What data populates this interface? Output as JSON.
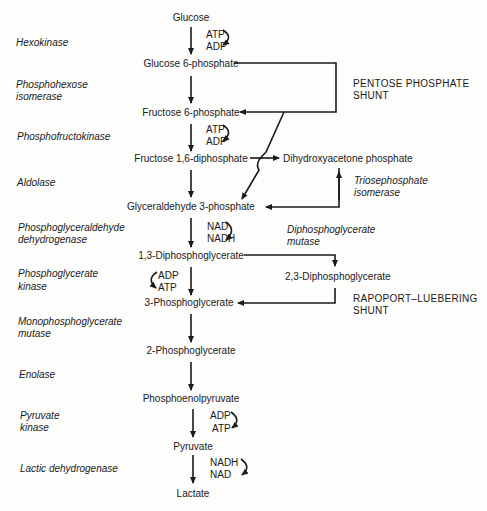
{
  "diagram": {
    "type": "metabolic-pathway",
    "metabolites": [
      {
        "id": "glucose",
        "label": "Glucose"
      },
      {
        "id": "g6p",
        "label": "Glucose 6-phosphate"
      },
      {
        "id": "f6p",
        "label": "Fructose 6-phosphate"
      },
      {
        "id": "f16dp",
        "label": "Fructose 1,6-diphosphate"
      },
      {
        "id": "dhap",
        "label": "Dihydroxyacetone phosphate"
      },
      {
        "id": "g3p",
        "label": "Glyceraldehyde 3-phosphate"
      },
      {
        "id": "bpg13",
        "label": "1,3-Diphosphoglycerate"
      },
      {
        "id": "bpg23",
        "label": "2,3-Diphosphoglycerate"
      },
      {
        "id": "pg3",
        "label": "3-Phosphoglycerate"
      },
      {
        "id": "pg2",
        "label": "2-Phosphoglycerate"
      },
      {
        "id": "pep",
        "label": "Phosphoenolpyruvate"
      },
      {
        "id": "pyruvate",
        "label": "Pyruvate"
      },
      {
        "id": "lactate",
        "label": "Lactate"
      }
    ],
    "enzymes": [
      {
        "id": "hk",
        "label": "Hexokinase"
      },
      {
        "id": "phi_1",
        "label": "Phosphohexose"
      },
      {
        "id": "phi_2",
        "label": "isomerase"
      },
      {
        "id": "pfk",
        "label": "Phosphofructokinase"
      },
      {
        "id": "ald",
        "label": "Aldolase"
      },
      {
        "id": "gapdh_1",
        "label": "Phosphoglyceraldehyde"
      },
      {
        "id": "gapdh_2",
        "label": "dehydrogenase"
      },
      {
        "id": "pgk_1",
        "label": "Phosphoglycerate"
      },
      {
        "id": "pgk_2",
        "label": "kinase"
      },
      {
        "id": "pgm_1",
        "label": "Monophosphoglycerate"
      },
      {
        "id": "pgm_2",
        "label": "mutase"
      },
      {
        "id": "eno",
        "label": "Enolase"
      },
      {
        "id": "pk_1",
        "label": "Pyruvate"
      },
      {
        "id": "pk_2",
        "label": "kinase"
      },
      {
        "id": "ldh",
        "label": "Lactic dehydrogenase"
      },
      {
        "id": "tpi_1",
        "label": "Triosephosphate"
      },
      {
        "id": "tpi_2",
        "label": "isomerase"
      },
      {
        "id": "dpgm_1",
        "label": "Diphosphoglycerate"
      },
      {
        "id": "dpgm_2",
        "label": "mutase"
      }
    ],
    "cofactors": {
      "hk": {
        "in": "ATP",
        "out": "ADP"
      },
      "pfk": {
        "in": "ATP",
        "out": "ADP"
      },
      "gapdh": {
        "in": "NAD",
        "out": "NADH"
      },
      "pgk": {
        "in": "ADP",
        "out": "ATP"
      },
      "pk": {
        "in": "ADP",
        "out": "ATP"
      },
      "ldh": {
        "in": "NADH",
        "out": "NAD"
      }
    },
    "shunts": {
      "pentose_1": "PENTOSE PHOSPHATE",
      "pentose_2": "SHUNT",
      "rapoport_1": "RAPOPORT–LUEBERING",
      "rapoport_2": "SHUNT"
    },
    "edges": [
      {
        "from": "glucose",
        "to": "g6p",
        "enzyme": "Hexokinase"
      },
      {
        "from": "g6p",
        "to": "f6p",
        "enzyme": "Phosphohexose isomerase"
      },
      {
        "from": "g6p",
        "to": "f6p",
        "via": "Pentose phosphate shunt"
      },
      {
        "from": "g6p",
        "to": "g3p",
        "via": "Pentose phosphate shunt"
      },
      {
        "from": "f6p",
        "to": "f16dp",
        "enzyme": "Phosphofructokinase"
      },
      {
        "from": "f16dp",
        "to": "g3p",
        "enzyme": "Aldolase"
      },
      {
        "from": "f16dp",
        "to": "dhap",
        "enzyme": "Aldolase"
      },
      {
        "from": "dhap",
        "to": "g3p",
        "enzyme": "Triosephosphate isomerase",
        "bidirectional": true
      },
      {
        "from": "g3p",
        "to": "bpg13",
        "enzyme": "Phosphoglyceraldehyde dehydrogenase"
      },
      {
        "from": "bpg13",
        "to": "pg3",
        "enzyme": "Phosphoglycerate kinase"
      },
      {
        "from": "bpg13",
        "to": "bpg23",
        "enzyme": "Diphosphoglycerate mutase"
      },
      {
        "from": "bpg23",
        "to": "pg3",
        "via": "Rapoport–Luebering shunt"
      },
      {
        "from": "pg3",
        "to": "pg2",
        "enzyme": "Monophosphoglycerate mutase"
      },
      {
        "from": "pg2",
        "to": "pep",
        "enzyme": "Enolase"
      },
      {
        "from": "pep",
        "to": "pyruvate",
        "enzyme": "Pyruvate kinase"
      },
      {
        "from": "pyruvate",
        "to": "lactate",
        "enzyme": "Lactic dehydrogenase"
      }
    ]
  }
}
